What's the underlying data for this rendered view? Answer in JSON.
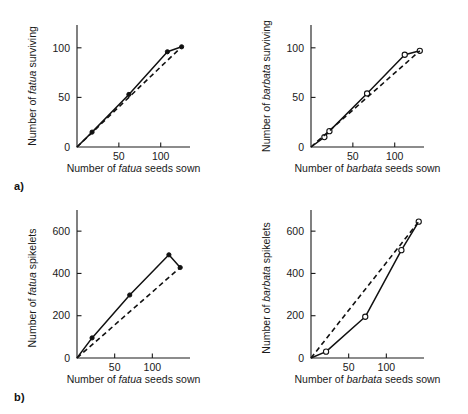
{
  "figure": {
    "panel_a_label": "a)",
    "panel_b_label": "b)"
  },
  "chart_data": [
    {
      "id": "panel-a-left",
      "type": "line",
      "title": "",
      "xlabel": "Number of fatua seeds sown",
      "ylabel": "Number of fatua surviving",
      "xlabel_italic_word": "fatua",
      "ylabel_italic_word": "fatua",
      "xlim": [
        0,
        135
      ],
      "ylim": [
        0,
        123
      ],
      "xticks": [
        50,
        100
      ],
      "xticklabels": [
        "50",
        "100"
      ],
      "yticks": [
        0,
        50,
        100
      ],
      "yticklabels": [
        "0",
        "50",
        "100"
      ],
      "grid": false,
      "legend": "none",
      "marker": "filled-circle",
      "series": [
        {
          "name": "observed",
          "style": "solid",
          "x": [
            0,
            18,
            62,
            108,
            125
          ],
          "y": [
            0,
            15,
            53,
            96,
            101
          ]
        },
        {
          "name": "expected",
          "style": "dashed",
          "x": [
            0,
            125
          ],
          "y": [
            0,
            101
          ]
        }
      ]
    },
    {
      "id": "panel-a-right",
      "type": "line",
      "title": "",
      "xlabel": "Number of barbata seeds sown",
      "ylabel": "Number of barbata surviving",
      "xlabel_italic_word": "barbata",
      "ylabel_italic_word": "barbata",
      "xlim": [
        0,
        135
      ],
      "ylim": [
        0,
        123
      ],
      "xticks": [
        50,
        100
      ],
      "xticklabels": [
        "50",
        "100"
      ],
      "yticks": [
        0,
        50,
        100
      ],
      "yticklabels": [
        "0",
        "50",
        "100"
      ],
      "grid": false,
      "legend": "none",
      "marker": "open-circle",
      "series": [
        {
          "name": "observed",
          "style": "solid",
          "x": [
            0,
            16,
            22,
            67,
            112,
            130
          ],
          "y": [
            0,
            10,
            16,
            54,
            93,
            97
          ]
        },
        {
          "name": "expected",
          "style": "dashed",
          "x": [
            0,
            130
          ],
          "y": [
            0,
            97
          ]
        }
      ]
    },
    {
      "id": "panel-b-left",
      "type": "line",
      "title": "",
      "xlabel": "Number of fatua seeds sown",
      "ylabel": "Number of fatua spikelets",
      "xlabel_italic_word": "fatua",
      "ylabel_italic_word": "fatua",
      "xlim": [
        0,
        150
      ],
      "ylim": [
        0,
        700
      ],
      "xticks": [
        50,
        100
      ],
      "xticklabels": [
        "50",
        "100"
      ],
      "yticks": [
        0,
        200,
        400,
        600
      ],
      "yticklabels": [
        "0",
        "200",
        "400",
        "600"
      ],
      "grid": false,
      "legend": "none",
      "marker": "filled-circle",
      "series": [
        {
          "name": "observed",
          "style": "solid",
          "x": [
            0,
            20,
            70,
            122,
            137
          ],
          "y": [
            0,
            95,
            298,
            488,
            428
          ]
        },
        {
          "name": "expected",
          "style": "dashed",
          "x": [
            0,
            137
          ],
          "y": [
            0,
            428
          ]
        }
      ]
    },
    {
      "id": "panel-b-right",
      "type": "line",
      "title": "",
      "xlabel": "Number of barbata seeds sown",
      "ylabel": "Number of barbata spikelets",
      "xlabel_italic_word": "barbata",
      "ylabel_italic_word": "barbata",
      "xlim": [
        0,
        150
      ],
      "ylim": [
        0,
        700
      ],
      "xticks": [
        50,
        100
      ],
      "xticklabels": [
        "50",
        "100"
      ],
      "yticks": [
        0,
        200,
        400,
        600
      ],
      "yticklabels": [
        "0",
        "200",
        "400",
        "600"
      ],
      "grid": false,
      "legend": "none",
      "marker": "open-circle",
      "series": [
        {
          "name": "observed",
          "style": "solid",
          "x": [
            0,
            20,
            72,
            120,
            143
          ],
          "y": [
            0,
            30,
            195,
            510,
            645
          ]
        },
        {
          "name": "expected",
          "style": "dashed",
          "x": [
            0,
            143
          ],
          "y": [
            0,
            645
          ]
        }
      ]
    }
  ]
}
